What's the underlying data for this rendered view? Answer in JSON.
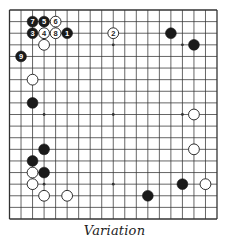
{
  "diagram": {
    "type": "go-board",
    "size": 19,
    "colors": {
      "line": "#333333",
      "black_stone": "#1a1a1a",
      "white_stone": "#ffffff",
      "background": "#ffffff"
    },
    "star_points": [
      [
        3,
        3
      ],
      [
        3,
        9
      ],
      [
        3,
        15
      ],
      [
        9,
        3
      ],
      [
        9,
        9
      ],
      [
        9,
        15
      ],
      [
        15,
        3
      ],
      [
        15,
        9
      ],
      [
        15,
        15
      ]
    ],
    "stones": [
      {
        "col": 2,
        "row": 1,
        "color": "black",
        "label": "7"
      },
      {
        "col": 3,
        "row": 1,
        "color": "black",
        "label": "5"
      },
      {
        "col": 4,
        "row": 1,
        "color": "white",
        "label": "6"
      },
      {
        "col": 2,
        "row": 2,
        "color": "black",
        "label": "3"
      },
      {
        "col": 3,
        "row": 2,
        "color": "white",
        "label": "4"
      },
      {
        "col": 4,
        "row": 2,
        "color": "white",
        "label": "8"
      },
      {
        "col": 5,
        "row": 2,
        "color": "black",
        "label": "1"
      },
      {
        "col": 9,
        "row": 2,
        "color": "white",
        "label": "2"
      },
      {
        "col": 3,
        "row": 3,
        "color": "white",
        "label": ""
      },
      {
        "col": 1,
        "row": 4,
        "color": "black",
        "label": "9"
      },
      {
        "col": 14,
        "row": 2,
        "color": "black",
        "label": ""
      },
      {
        "col": 16,
        "row": 3,
        "color": "black",
        "label": ""
      },
      {
        "col": 2,
        "row": 6,
        "color": "white",
        "label": ""
      },
      {
        "col": 2,
        "row": 8,
        "color": "black",
        "label": ""
      },
      {
        "col": 16,
        "row": 9,
        "color": "white",
        "label": ""
      },
      {
        "col": 16,
        "row": 12,
        "color": "white",
        "label": ""
      },
      {
        "col": 3,
        "row": 12,
        "color": "black",
        "label": ""
      },
      {
        "col": 2,
        "row": 13,
        "color": "black",
        "label": ""
      },
      {
        "col": 2,
        "row": 14,
        "color": "white",
        "label": ""
      },
      {
        "col": 3,
        "row": 14,
        "color": "black",
        "label": ""
      },
      {
        "col": 2,
        "row": 15,
        "color": "white",
        "label": ""
      },
      {
        "col": 3,
        "row": 16,
        "color": "white",
        "label": ""
      },
      {
        "col": 5,
        "row": 16,
        "color": "white",
        "label": ""
      },
      {
        "col": 12,
        "row": 16,
        "color": "black",
        "label": ""
      },
      {
        "col": 15,
        "row": 15,
        "color": "black",
        "label": ""
      },
      {
        "col": 17,
        "row": 15,
        "color": "white",
        "label": ""
      }
    ]
  },
  "caption": "Variation"
}
